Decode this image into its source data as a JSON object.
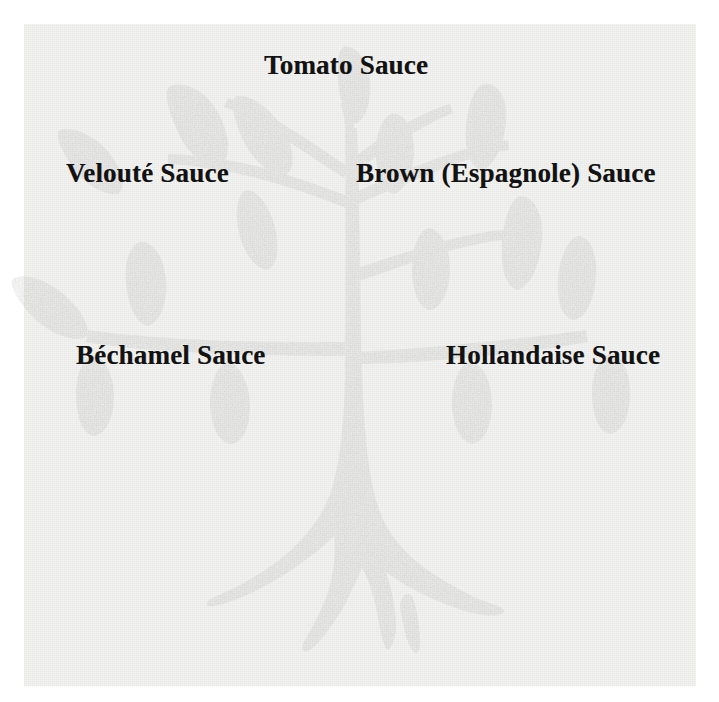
{
  "diagram": {
    "style": "scanned-grayscale-halftone",
    "tree_color": "#9a9a9a",
    "background_color": "#f3f3f1",
    "text_color": "#121212",
    "labels": [
      {
        "id": "tomato",
        "text": "Tomato Sauce",
        "position": "top-center"
      },
      {
        "id": "veloute",
        "text": "Velouté Sauce",
        "position": "upper-left"
      },
      {
        "id": "brown",
        "text": "Brown (Espagnole) Sauce",
        "position": "upper-right"
      },
      {
        "id": "bechamel",
        "text": "Béchamel Sauce",
        "position": "lower-left"
      },
      {
        "id": "hollandaise",
        "text": "Hollandaise Sauce",
        "position": "lower-right"
      }
    ],
    "tree": {
      "element": "stylized-tree-silhouette",
      "parts": [
        "trunk",
        "flared-roots",
        "branches",
        "leaves"
      ],
      "leaf_count": 14,
      "branch_count": 6
    }
  }
}
